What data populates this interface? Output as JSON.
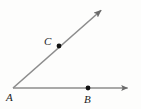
{
  "figure": {
    "type": "geometry-angle-diagram",
    "background_color": "#fdfdfc",
    "line_color": "#8c8c8c",
    "arrow_color": "#6b6b6b",
    "point_color": "#121212",
    "label_color": "#1c1c1c",
    "width": 141,
    "height": 109,
    "vertex": {
      "name": "A",
      "label": "A",
      "x": 13,
      "y": 88,
      "label_x": 6,
      "label_y": 92,
      "has_dot": false
    },
    "points": [
      {
        "name": "B",
        "label": "B",
        "x": 88,
        "y": 88,
        "label_x": 84,
        "label_y": 94,
        "has_dot": true,
        "dot_radius": 2.4,
        "on_ray": "AB"
      },
      {
        "name": "C",
        "label": "C",
        "x": 59,
        "y": 46,
        "label_x": 44,
        "label_y": 36,
        "has_dot": true,
        "dot_radius": 2.4,
        "on_ray": "AC"
      }
    ],
    "rays": [
      {
        "name": "ray-AB",
        "from": "A",
        "through": "B",
        "start_x": 13,
        "start_y": 88,
        "end_x": 134,
        "end_y": 88,
        "stroke_width": 1.6,
        "arrowhead": "end"
      },
      {
        "name": "ray-AC",
        "from": "A",
        "through": "C",
        "start_x": 13,
        "start_y": 88,
        "end_x": 106,
        "end_y": 6,
        "stroke_width": 1.6,
        "arrowhead": "end"
      }
    ],
    "arrowheads": [
      {
        "name": "arrowhead-AB",
        "tip_x": 134,
        "tip_y": 88,
        "angle_deg": 0
      },
      {
        "name": "arrowhead-AC",
        "tip_x": 106,
        "tip_y": 6,
        "angle_deg": -41
      }
    ]
  }
}
